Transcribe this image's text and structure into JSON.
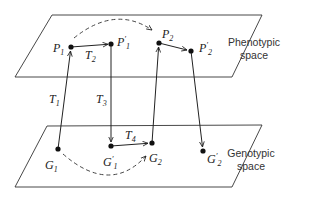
{
  "figure": {
    "planes": {
      "phenotypic": {
        "label_line1": "Phenotypic",
        "label_line2": "space"
      },
      "genotypic": {
        "label_line1": "Genotypic",
        "label_line2": "space"
      }
    },
    "points": {
      "P1": {
        "base": "P",
        "sub": "1",
        "prime": ""
      },
      "P1p": {
        "base": "P",
        "sub": "1",
        "prime": "′"
      },
      "P2": {
        "base": "P",
        "sub": "2",
        "prime": ""
      },
      "P2p": {
        "base": "P",
        "sub": "2",
        "prime": "′"
      },
      "G1": {
        "base": "G",
        "sub": "1",
        "prime": ""
      },
      "G1p": {
        "base": "G",
        "sub": "1",
        "prime": "′"
      },
      "G2": {
        "base": "G",
        "sub": "2",
        "prime": ""
      },
      "G2p": {
        "base": "G",
        "sub": "2",
        "prime": "′"
      }
    },
    "transforms": {
      "T1": {
        "base": "T",
        "sub": "1"
      },
      "T2": {
        "base": "T",
        "sub": "2"
      },
      "T3": {
        "base": "T",
        "sub": "3"
      },
      "T4": {
        "base": "T",
        "sub": "4"
      }
    },
    "colors": {
      "ink": "#222222",
      "background": "#ffffff"
    }
  }
}
